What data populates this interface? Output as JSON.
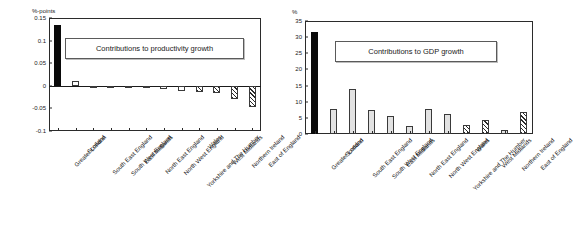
{
  "figure": {
    "panels": [
      {
        "id": "productivity",
        "unit_label": "%-points",
        "title": "Contributions to productivity growth",
        "y_ticks": [
          "0.15",
          "0.1",
          "0.05",
          "0",
          "-0.05",
          "-0.1"
        ]
      },
      {
        "id": "gdp",
        "unit_label": "%",
        "title": "Contributions to GDP growth",
        "y_ticks": [
          "35",
          "30",
          "25",
          "20",
          "15",
          "10",
          "5",
          "0"
        ]
      }
    ]
  },
  "chart_data": [
    {
      "type": "bar",
      "title": "Contributions to productivity growth",
      "xlabel": "",
      "ylabel": "%-points",
      "ylim": [
        -0.1,
        0.15
      ],
      "yticks": [
        0.15,
        0.1,
        0.05,
        0,
        -0.05,
        -0.1
      ],
      "grid": false,
      "legend": "none",
      "categories": [
        "Greater London",
        "Scotland",
        "South East England",
        "South West England",
        "East Midlands",
        "North East England",
        "North West England",
        "Yorkshire and The Humber",
        "Wales",
        "West Midlands",
        "Northern Ireland",
        "East of England"
      ],
      "values": [
        0.135,
        0.011,
        -0.001,
        -0.001,
        -0.001,
        -0.002,
        -0.006,
        -0.012,
        -0.014,
        -0.016,
        -0.029,
        -0.046
      ],
      "bar_styles": [
        "black",
        "white",
        "white",
        "white",
        "white",
        "white",
        "white",
        "white",
        "hatch",
        "hatch",
        "hatch",
        "hatch"
      ]
    },
    {
      "type": "bar",
      "title": "Contributions to GDP growth",
      "xlabel": "",
      "ylabel": "%",
      "ylim": [
        0,
        35
      ],
      "yticks": [
        0,
        5,
        10,
        15,
        20,
        25,
        30,
        35
      ],
      "grid": false,
      "legend": "none",
      "categories": [
        "Greater London",
        "Scotland",
        "South East England",
        "South West England",
        "East Midlands",
        "North East England",
        "North West England",
        "Yorkshire and The Humber",
        "Wales",
        "West Midlands",
        "Northern Ireland",
        "East of England"
      ],
      "values": [
        31.5,
        7.6,
        13.9,
        7.5,
        5.5,
        2.5,
        7.7,
        6.2,
        2.9,
        4.4,
        1.3,
        6.7
      ],
      "bar_styles": [
        "black",
        "grey",
        "grey",
        "grey",
        "grey",
        "grey",
        "grey",
        "grey",
        "hatch",
        "hatch",
        "grey",
        "hatch"
      ]
    }
  ]
}
